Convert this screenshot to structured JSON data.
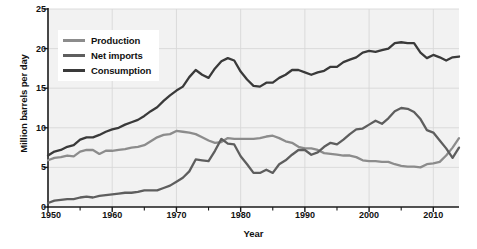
{
  "chart_data": {
    "type": "line",
    "title": "",
    "xlabel": "Year",
    "ylabel": "Million barrels per day",
    "xlim": [
      1950,
      2014
    ],
    "ylim": [
      0,
      25
    ],
    "yticks": [
      0,
      5,
      10,
      15,
      20,
      25
    ],
    "xticks": [
      1950,
      1960,
      1970,
      1980,
      1990,
      2000,
      2010
    ],
    "xminor_step": 5,
    "grid": true,
    "legend_position": "upper-left-inside",
    "x": [
      1950,
      1951,
      1952,
      1953,
      1954,
      1955,
      1956,
      1957,
      1958,
      1959,
      1960,
      1961,
      1962,
      1963,
      1964,
      1965,
      1966,
      1967,
      1968,
      1969,
      1970,
      1971,
      1972,
      1973,
      1974,
      1975,
      1976,
      1977,
      1978,
      1979,
      1980,
      1981,
      1982,
      1983,
      1984,
      1985,
      1986,
      1987,
      1988,
      1989,
      1990,
      1991,
      1992,
      1993,
      1994,
      1995,
      1996,
      1997,
      1998,
      1999,
      2000,
      2001,
      2002,
      2003,
      2004,
      2005,
      2006,
      2007,
      2008,
      2009,
      2010,
      2011,
      2012,
      2013,
      2014
    ],
    "series": [
      {
        "name": "Production",
        "color": "#8c8c8c",
        "values": [
          5.9,
          6.2,
          6.3,
          6.5,
          6.4,
          7.0,
          7.2,
          7.2,
          6.7,
          7.1,
          7.1,
          7.2,
          7.3,
          7.5,
          7.6,
          7.8,
          8.3,
          8.8,
          9.1,
          9.2,
          9.6,
          9.5,
          9.4,
          9.2,
          8.8,
          8.4,
          8.1,
          8.2,
          8.7,
          8.6,
          8.6,
          8.6,
          8.6,
          8.7,
          8.9,
          9.0,
          8.7,
          8.3,
          8.1,
          7.6,
          7.4,
          7.4,
          7.2,
          6.8,
          6.7,
          6.6,
          6.5,
          6.5,
          6.3,
          5.9,
          5.8,
          5.8,
          5.7,
          5.7,
          5.4,
          5.2,
          5.1,
          5.1,
          5.0,
          5.4,
          5.5,
          5.7,
          6.5,
          7.5,
          8.7
        ],
        "peak": {
          "year": 1970,
          "value": 9.6
        },
        "end_value": 8.7
      },
      {
        "name": "Net imports",
        "color": "#5e5e5e",
        "values": [
          0.5,
          0.8,
          0.9,
          1.0,
          1.0,
          1.2,
          1.3,
          1.2,
          1.4,
          1.5,
          1.6,
          1.7,
          1.8,
          1.8,
          1.9,
          2.1,
          2.1,
          2.1,
          2.4,
          2.7,
          3.2,
          3.7,
          4.5,
          6.0,
          5.9,
          5.8,
          7.1,
          8.6,
          8.0,
          7.9,
          6.4,
          5.4,
          4.3,
          4.3,
          4.7,
          4.3,
          5.4,
          5.9,
          6.6,
          7.2,
          7.2,
          6.6,
          6.9,
          7.6,
          8.1,
          7.9,
          8.5,
          9.2,
          9.8,
          9.9,
          10.4,
          10.9,
          10.5,
          11.2,
          12.1,
          12.5,
          12.4,
          12.0,
          11.1,
          9.7,
          9.4,
          8.4,
          7.4,
          6.2,
          7.5
        ],
        "peak": {
          "year": 2005,
          "value": 12.5
        },
        "end_value": 7.5
      },
      {
        "name": "Consumption",
        "color": "#3a3a3a",
        "values": [
          6.5,
          7.0,
          7.2,
          7.6,
          7.8,
          8.5,
          8.8,
          8.8,
          9.1,
          9.5,
          9.8,
          10.0,
          10.4,
          10.7,
          11.0,
          11.5,
          12.1,
          12.6,
          13.4,
          14.1,
          14.7,
          15.2,
          16.4,
          17.3,
          16.7,
          16.3,
          17.5,
          18.4,
          18.8,
          18.5,
          17.1,
          16.1,
          15.3,
          15.2,
          15.7,
          15.7,
          16.3,
          16.7,
          17.3,
          17.3,
          17.0,
          16.7,
          17.0,
          17.2,
          17.7,
          17.7,
          18.3,
          18.6,
          18.9,
          19.5,
          19.7,
          19.6,
          19.8,
          20.0,
          20.7,
          20.8,
          20.7,
          20.7,
          19.5,
          18.8,
          19.2,
          18.9,
          18.5,
          18.9,
          19.0
        ],
        "peak": {
          "year": 2005,
          "value": 20.8
        },
        "end_value": 19.0
      }
    ]
  },
  "legend": {
    "items": [
      {
        "label": "Production"
      },
      {
        "label": "Net imports"
      },
      {
        "label": "Consumption"
      }
    ]
  },
  "axes": {
    "y_title": "Million barrels per day",
    "x_title": "Year",
    "y_tick_labels": [
      "0",
      "5",
      "10",
      "15",
      "20",
      "25"
    ],
    "x_tick_labels": [
      "1950",
      "1960",
      "1970",
      "1980",
      "1990",
      "2000",
      "2010"
    ]
  },
  "colors": {
    "plot_background": "#f2f2f2",
    "grid": "#d8d8d8",
    "axis": "#1a1a1a",
    "production": "#8c8c8c",
    "net_imports": "#5e5e5e",
    "consumption": "#3a3a3a"
  }
}
